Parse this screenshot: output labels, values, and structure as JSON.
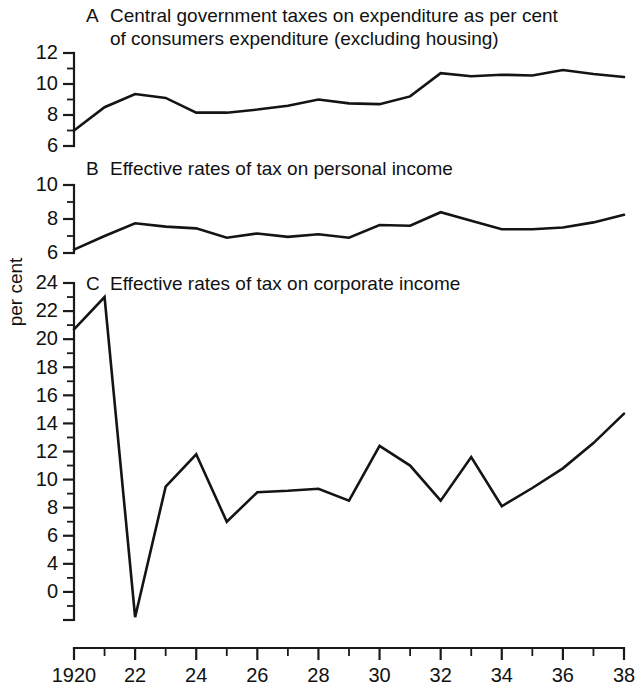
{
  "figure": {
    "y_axis_label": "per cent",
    "background_color": "#ffffff",
    "line_color": "#141414"
  },
  "x_axis": {
    "label": "",
    "first_tick_label": "1920",
    "tick_labels": [
      "1920",
      "22",
      "24",
      "26",
      "28",
      "30",
      "32",
      "34",
      "36",
      "38"
    ],
    "tick_years": [
      1920,
      1922,
      1924,
      1926,
      1928,
      1930,
      1932,
      1934,
      1936,
      1938
    ],
    "range": [
      1920,
      1938
    ]
  },
  "panels": [
    {
      "letter": "A",
      "title_line1": "Central government taxes on expenditure as per cent",
      "title_line2": "of consumers expenditure (excluding housing)",
      "y_labels": [
        "12",
        "10",
        "8",
        "6"
      ]
    },
    {
      "letter": "B",
      "title_line1": "Effective rates of tax on personal income",
      "title_line2": "",
      "y_labels": [
        "10",
        "8",
        "6"
      ]
    },
    {
      "letter": "C",
      "title_line1": "Effective rates of tax on corporate income",
      "title_line2": "",
      "y_labels": [
        "24",
        "22",
        "20",
        "18",
        "16",
        "14",
        "12",
        "10",
        "8",
        "6",
        "4",
        "0"
      ]
    }
  ],
  "chart_data": [
    {
      "type": "line",
      "panel": "A",
      "title": "Central government taxes on expenditure as per cent of consumers expenditure (excluding housing)",
      "xlabel": "",
      "ylabel": "per cent",
      "xlim": [
        1920,
        1938
      ],
      "ylim": [
        6,
        12
      ],
      "yticks": [
        6,
        7,
        8,
        9,
        10,
        11,
        12
      ],
      "ytick_labels": [
        "6",
        "",
        "8",
        "",
        "10",
        "",
        "12"
      ],
      "grid": false,
      "legend": false,
      "x": [
        1920,
        1921,
        1922,
        1923,
        1924,
        1925,
        1926,
        1927,
        1928,
        1929,
        1930,
        1931,
        1932,
        1933,
        1934,
        1935,
        1936,
        1937,
        1938
      ],
      "values": [
        7.0,
        8.5,
        9.35,
        9.1,
        8.15,
        8.15,
        8.35,
        8.6,
        9.0,
        8.75,
        8.7,
        9.2,
        10.7,
        10.5,
        10.6,
        10.55,
        10.9,
        10.65,
        10.45
      ]
    },
    {
      "type": "line",
      "panel": "B",
      "title": "Effective rates of tax on personal income",
      "xlabel": "",
      "ylabel": "per cent",
      "xlim": [
        1920,
        1938
      ],
      "ylim": [
        6,
        10
      ],
      "yticks": [
        6,
        7,
        8,
        9,
        10
      ],
      "ytick_labels": [
        "6",
        "",
        "8",
        "",
        "10"
      ],
      "grid": false,
      "legend": false,
      "x": [
        1920,
        1921,
        1922,
        1923,
        1924,
        1925,
        1926,
        1927,
        1928,
        1929,
        1930,
        1931,
        1932,
        1933,
        1934,
        1935,
        1936,
        1937,
        1938
      ],
      "values": [
        6.2,
        7.0,
        7.75,
        7.55,
        7.45,
        6.9,
        7.15,
        6.95,
        7.1,
        6.9,
        7.65,
        7.6,
        8.4,
        7.9,
        7.4,
        7.4,
        7.5,
        7.8,
        8.25
      ]
    },
    {
      "type": "line",
      "panel": "C",
      "title": "Effective rates of tax on corporate income",
      "xlabel": "",
      "ylabel": "per cent",
      "xlim": [
        1920,
        1938
      ],
      "ylim": [
        0,
        24
      ],
      "yticks": [
        0,
        2,
        4,
        6,
        8,
        10,
        12,
        14,
        16,
        18,
        20,
        22,
        24
      ],
      "ytick_labels": [
        "0",
        "",
        "4",
        "6",
        "8",
        "10",
        "12",
        "14",
        "16",
        "18",
        "20",
        "22",
        "24"
      ],
      "grid": false,
      "legend": false,
      "x": [
        1920,
        1921,
        1922,
        1923,
        1924,
        1925,
        1926,
        1927,
        1928,
        1929,
        1930,
        1931,
        1932,
        1933,
        1934,
        1935,
        1936,
        1937,
        1938
      ],
      "values": [
        20.7,
        23.0,
        0.2,
        9.5,
        11.8,
        7.0,
        9.1,
        9.2,
        9.35,
        8.5,
        12.4,
        11.0,
        8.5,
        11.6,
        8.1,
        9.4,
        10.8,
        12.6,
        14.7
      ]
    }
  ]
}
